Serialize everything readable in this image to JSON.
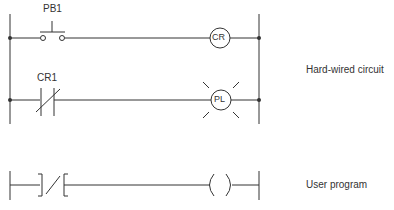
{
  "diagram": {
    "hardwired": {
      "caption": "Hard-wired circuit",
      "rung1": {
        "input_label": "PB1",
        "output_label": "CR"
      },
      "rung2": {
        "input_label": "CR1",
        "output_label": "PL"
      }
    },
    "user_program": {
      "caption": "User program"
    }
  },
  "colors": {
    "line": "#333333",
    "background": "#ffffff"
  }
}
